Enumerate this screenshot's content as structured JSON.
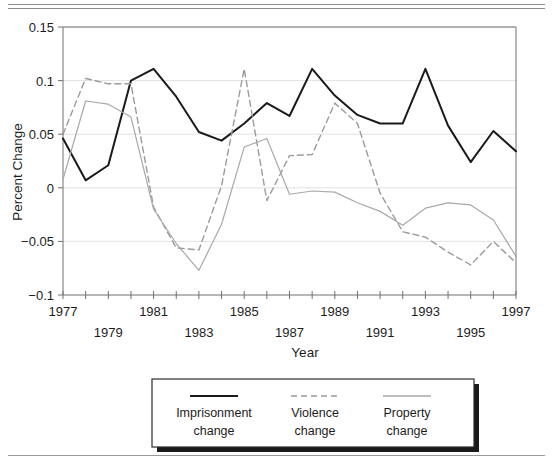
{
  "chart_data": {
    "type": "line",
    "title": "",
    "xlabel": "Year",
    "ylabel": "Percent Change",
    "x": [
      1977,
      1978,
      1979,
      1980,
      1981,
      1982,
      1983,
      1984,
      1985,
      1986,
      1987,
      1988,
      1989,
      1990,
      1991,
      1992,
      1993,
      1994,
      1995,
      1996,
      1997
    ],
    "xlim": [
      1977,
      1997
    ],
    "ylim": [
      -0.1,
      0.15
    ],
    "yticks": [
      -0.1,
      -0.05,
      0,
      0.05,
      0.1,
      0.15
    ],
    "ytick_labels": [
      "−0.1",
      "−0.05",
      "0",
      "0.05",
      "0.1",
      "0.15"
    ],
    "xticks": [
      1977,
      1978,
      1979,
      1980,
      1981,
      1982,
      1983,
      1984,
      1985,
      1986,
      1987,
      1988,
      1989,
      1990,
      1991,
      1992,
      1993,
      1994,
      1995,
      1996,
      1997
    ],
    "xtick_labels_row1": [
      "1977",
      "1981",
      "1985",
      "1989",
      "1993",
      "1997"
    ],
    "xtick_labels_row2": [
      "1979",
      "1983",
      "1987",
      "1991",
      "1995"
    ],
    "xtick_row1_years": [
      1977,
      1981,
      1985,
      1989,
      1993,
      1997
    ],
    "xtick_row2_years": [
      1979,
      1983,
      1987,
      1991,
      1995
    ],
    "grid": "horizontal",
    "legend_position": "below",
    "series": [
      {
        "name": "Imprisonment change",
        "legend_line1": "Imprisonment",
        "legend_line2": "change",
        "style": "solid",
        "color": "#1a1a1a",
        "width": 2.0,
        "values": [
          0.046,
          0.007,
          0.021,
          0.1,
          0.111,
          0.085,
          0.052,
          0.044,
          0.06,
          0.079,
          0.067,
          0.111,
          0.086,
          0.068,
          0.06,
          0.06,
          0.111,
          0.058,
          0.024,
          0.053,
          0.034
        ]
      },
      {
        "name": "Violence change",
        "legend_line1": "Violence",
        "legend_line2": "change",
        "style": "dashed",
        "color": "#9b9b9b",
        "width": 1.4,
        "values": [
          0.05,
          0.102,
          0.097,
          0.097,
          -0.018,
          -0.056,
          -0.058,
          0.002,
          0.111,
          -0.012,
          0.03,
          0.031,
          0.079,
          0.06,
          -0.005,
          -0.041,
          -0.046,
          -0.06,
          -0.072,
          -0.05,
          -0.07
        ]
      },
      {
        "name": "Property change",
        "legend_line1": "Property",
        "legend_line2": "change",
        "style": "solid",
        "color": "#a9a9a9",
        "width": 1.2,
        "values": [
          0.008,
          0.081,
          0.078,
          0.066,
          -0.02,
          -0.052,
          -0.077,
          -0.034,
          0.038,
          0.046,
          -0.006,
          -0.003,
          -0.004,
          -0.014,
          -0.022,
          -0.035,
          -0.019,
          -0.014,
          -0.016,
          -0.03,
          -0.064
        ]
      }
    ]
  },
  "legend": {
    "items": [
      {
        "label_line1": "Imprisonment",
        "label_line2": "change",
        "swatch": "solid-black-line-swatch"
      },
      {
        "label_line1": "Violence",
        "label_line2": "change",
        "swatch": "dashed-gray-line-swatch"
      },
      {
        "label_line1": "Property",
        "label_line2": "change",
        "swatch": "solid-gray-line-swatch"
      }
    ]
  },
  "colors": {
    "imprisonment": "#1a1a1a",
    "violence": "#9b9b9b",
    "property": "#a9a9a9",
    "grid": "#e2e2e2",
    "axis": "#707070",
    "rule": "#8d8d8d"
  }
}
